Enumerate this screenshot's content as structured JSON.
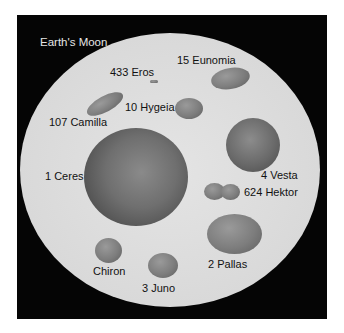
{
  "title": "Earth's Moon",
  "frame": {
    "background": "#050505",
    "moon_disc_color": "#dadada"
  },
  "bodies": [
    {
      "id": "ceres",
      "label": "1 Ceres"
    },
    {
      "id": "pallas",
      "label": "2 Pallas"
    },
    {
      "id": "juno",
      "label": "3 Juno"
    },
    {
      "id": "vesta",
      "label": "4 Vesta"
    },
    {
      "id": "hygeia",
      "label": "10 Hygeia"
    },
    {
      "id": "eunomia",
      "label": "15 Eunomia"
    },
    {
      "id": "camilla",
      "label": "107 Camilla"
    },
    {
      "id": "eros",
      "label": "433 Eros"
    },
    {
      "id": "hektor",
      "label": "624 Hektor"
    },
    {
      "id": "chiron",
      "label": "Chiron"
    }
  ]
}
